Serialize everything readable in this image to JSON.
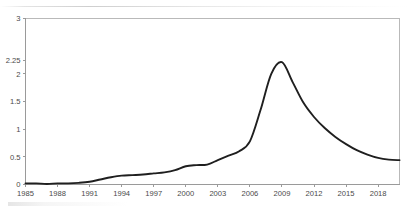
{
  "chart_data": {
    "type": "line",
    "title": "",
    "subtitle": "",
    "xlabel": "",
    "ylabel": "",
    "grid": false,
    "legend": "none",
    "legend_entries": [],
    "annotations": [],
    "line_color": "#1f1f1f",
    "axis_color": "#9a9a9a",
    "frame_color": "#b9b9b9",
    "background_color": "#ffffff",
    "xlim": [
      1985,
      2020
    ],
    "ylim": [
      0,
      3
    ],
    "xticks": [
      1985,
      1988,
      1991,
      1994,
      1997,
      2000,
      2003,
      2006,
      2009,
      2012,
      2015,
      2018
    ],
    "xtick_labels": [
      "1985",
      "1988",
      "1991",
      "1994",
      "1997",
      "2000",
      "2003",
      "2006",
      "2009",
      "2012",
      "2015",
      "2018"
    ],
    "yticks": [
      0,
      0.5,
      1,
      1.5,
      2,
      2.25,
      3
    ],
    "ytick_labels": [
      "0",
      "0.5",
      "1",
      "1.5",
      "2",
      "2.25",
      "3"
    ],
    "x": [
      1985,
      1986,
      1987,
      1988,
      1989,
      1990,
      1991,
      1992,
      1993,
      1994,
      1995,
      1996,
      1997,
      1998,
      1999,
      2000,
      2001,
      2002,
      2003,
      2004,
      2005,
      2006,
      2007,
      2008,
      2009,
      2010,
      2011,
      2012,
      2013,
      2014,
      2015,
      2016,
      2017,
      2018,
      2019,
      2020
    ],
    "values": [
      0.02,
      0.02,
      0.01,
      0.02,
      0.02,
      0.03,
      0.05,
      0.09,
      0.13,
      0.16,
      0.17,
      0.18,
      0.2,
      0.22,
      0.26,
      0.33,
      0.35,
      0.36,
      0.44,
      0.52,
      0.6,
      0.78,
      1.35,
      2.0,
      2.21,
      1.85,
      1.48,
      1.22,
      1.02,
      0.86,
      0.73,
      0.62,
      0.54,
      0.48,
      0.45,
      0.44
    ],
    "series": [
      {
        "name": "series-1",
        "values": [
          0.02,
          0.02,
          0.01,
          0.02,
          0.02,
          0.03,
          0.05,
          0.09,
          0.13,
          0.16,
          0.17,
          0.18,
          0.2,
          0.22,
          0.26,
          0.33,
          0.35,
          0.36,
          0.44,
          0.52,
          0.6,
          0.78,
          1.35,
          2.0,
          2.21,
          1.85,
          1.48,
          1.22,
          1.02,
          0.86,
          0.73,
          0.62,
          0.54,
          0.48,
          0.45,
          0.44
        ]
      }
    ],
    "peak": {
      "x": 2007.4,
      "y": 2.21
    }
  }
}
